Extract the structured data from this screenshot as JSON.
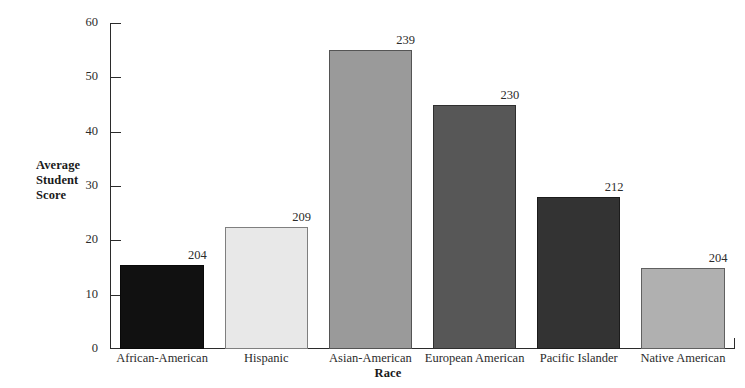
{
  "chart_data": {
    "type": "bar",
    "title": "",
    "xlabel": "Race",
    "ylabel": "Average Student Score",
    "ylabel_lines": [
      "Average",
      "Student",
      "Score"
    ],
    "categories": [
      "African-American",
      "Hispanic",
      "Asian-American",
      "European American",
      "Pacific Islander",
      "Native American"
    ],
    "values": [
      15.5,
      22.5,
      55,
      45,
      28,
      15
    ],
    "point_labels": [
      "204",
      "209",
      "239",
      "230",
      "212",
      "204"
    ],
    "bar_colors": [
      "#111111",
      "#e8e8e8",
      "#9a9a9a",
      "#575757",
      "#333333",
      "#b0b0b0"
    ],
    "ylim": [
      0,
      60
    ],
    "yticks": [
      0,
      10,
      20,
      30,
      40,
      50,
      60
    ],
    "ytick_labels": [
      "0",
      "10",
      "20",
      "30",
      "40",
      "50",
      "60"
    ],
    "grid": false,
    "legend": false,
    "axis_color": "#2b2b2b",
    "background": "#ffffff"
  },
  "axes": {
    "y_title_line1": "Average",
    "y_title_line2": "Student",
    "y_title_line3": "Score",
    "x_title": "Race"
  },
  "ticks": {
    "t0": "0",
    "t1": "10",
    "t2": "20",
    "t3": "30",
    "t4": "40",
    "t5": "50",
    "t6": "60"
  },
  "bars": [
    {
      "category": "African-American",
      "value": 15.5,
      "label": "204",
      "color": "#111111"
    },
    {
      "category": "Hispanic",
      "value": 22.5,
      "label": "209",
      "color": "#e8e8e8"
    },
    {
      "category": "Asian-American",
      "value": 55,
      "label": "239",
      "color": "#9a9a9a"
    },
    {
      "category": "European American",
      "value": 45,
      "label": "230",
      "color": "#575757"
    },
    {
      "category": "Pacific Islander",
      "value": 28,
      "label": "212",
      "color": "#333333"
    },
    {
      "category": "Native American",
      "value": 15,
      "label": "204",
      "color": "#b0b0b0"
    }
  ]
}
